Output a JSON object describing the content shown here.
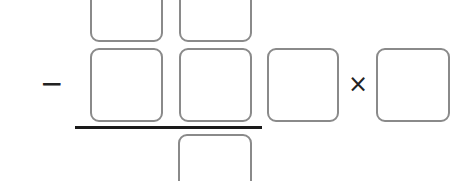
{
  "puzzle": {
    "operator_minus": "−",
    "operator_times": "×",
    "boxes": {
      "minuend_tens": "",
      "minuend_ones": "",
      "subtrahend_tens": "",
      "subtrahend_ones": "",
      "factor_a": "",
      "factor_b": "",
      "result": ""
    }
  },
  "colors": {
    "box_border": "#8a8a8a",
    "rule": "#1a1a1a",
    "text": "#222222"
  }
}
